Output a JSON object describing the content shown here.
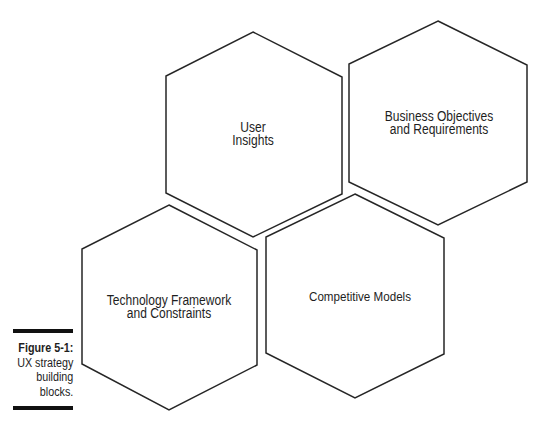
{
  "diagram": {
    "type": "hexagon-blocks",
    "stroke_color": "#262626",
    "fill_color": "#ffffff",
    "blocks": [
      {
        "id": "user-insights",
        "lines": [
          "User",
          "Insights"
        ],
        "points": "253,32 342,77 342,194 253,237 166,193 166,76",
        "label_center": [
          253,
          134
        ]
      },
      {
        "id": "business-objectives",
        "lines": [
          "Business Objectives",
          "and Requirements"
        ],
        "points": "438,21 527,65 527,182 438,225 349,182 349,64",
        "label_center": [
          439,
          123
        ]
      },
      {
        "id": "technology-framework",
        "lines": [
          "Technology Framework",
          "and Constraints"
        ],
        "points": "169,205 257,250 257,365 169,410 82,364 82,249",
        "label_center": [
          169,
          306
        ]
      },
      {
        "id": "competitive-models",
        "lines": [
          "Competitive Models"
        ],
        "points": "355,194 444,238 444,354 355,398 266,353 266,237",
        "label_center": [
          360,
          296
        ]
      }
    ]
  },
  "caption": {
    "figure_label": "Figure 5-1:",
    "lines": [
      "UX strategy",
      "building",
      "blocks."
    ]
  }
}
